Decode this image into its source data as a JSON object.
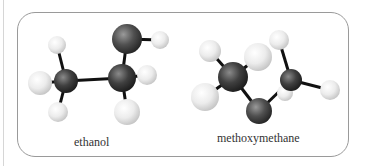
{
  "molecules": [
    {
      "name": "ethanol",
      "label": "ethanol",
      "atoms": [
        {
          "id": "H1",
          "element": "H",
          "x": 57,
          "y": 45,
          "r": 9
        },
        {
          "id": "H2",
          "element": "H",
          "x": 40,
          "y": 83,
          "r": 12
        },
        {
          "id": "H3",
          "element": "H",
          "x": 58,
          "y": 112,
          "r": 10
        },
        {
          "id": "C1",
          "element": "C",
          "x": 66,
          "y": 81,
          "r": 12
        },
        {
          "id": "O1",
          "element": "O",
          "x": 127,
          "y": 39,
          "r": 15
        },
        {
          "id": "H6",
          "element": "H",
          "x": 160,
          "y": 40,
          "r": 9
        },
        {
          "id": "H4",
          "element": "H",
          "x": 147,
          "y": 75,
          "r": 10
        },
        {
          "id": "C2",
          "element": "C",
          "x": 122,
          "y": 78,
          "r": 14
        },
        {
          "id": "H5",
          "element": "H",
          "x": 127,
          "y": 112,
          "r": 13
        }
      ],
      "bonds": [
        [
          "C1",
          "H1"
        ],
        [
          "C1",
          "H2"
        ],
        [
          "C1",
          "H3"
        ],
        [
          "C1",
          "C2"
        ],
        [
          "C2",
          "O1"
        ],
        [
          "O1",
          "H6"
        ],
        [
          "C2",
          "H4"
        ],
        [
          "C2",
          "H5"
        ]
      ]
    },
    {
      "name": "methoxymethane",
      "label": "methoxymethane",
      "atoms": [
        {
          "id": "H7",
          "element": "H",
          "x": 210,
          "y": 51,
          "r": 11
        },
        {
          "id": "H8",
          "element": "H",
          "x": 258,
          "y": 57,
          "r": 14
        },
        {
          "id": "H9",
          "element": "H",
          "x": 205,
          "y": 97,
          "r": 14
        },
        {
          "id": "C3",
          "element": "C",
          "x": 233,
          "y": 77,
          "r": 15
        },
        {
          "id": "H12",
          "element": "H",
          "x": 285,
          "y": 93,
          "r": 8
        },
        {
          "id": "O2",
          "element": "O",
          "x": 259,
          "y": 111,
          "r": 13
        },
        {
          "id": "H10",
          "element": "H",
          "x": 279,
          "y": 40,
          "r": 10
        },
        {
          "id": "C4",
          "element": "C",
          "x": 291,
          "y": 80,
          "r": 11
        },
        {
          "id": "H11",
          "element": "H",
          "x": 330,
          "y": 90,
          "r": 10
        }
      ],
      "bonds": [
        [
          "C3",
          "H7"
        ],
        [
          "C3",
          "H8"
        ],
        [
          "C3",
          "H9"
        ],
        [
          "C3",
          "O2"
        ],
        [
          "O2",
          "C4"
        ],
        [
          "C4",
          "H10"
        ],
        [
          "C4",
          "H11"
        ],
        [
          "C4",
          "H12"
        ]
      ]
    }
  ],
  "colors": {
    "frame_border": "#9a9a9a",
    "bond": "#111111",
    "carbon": "#3a3a3a",
    "oxygen": "#4a4a4a",
    "hydrogen": "#e6e6e6",
    "label": "#333333"
  }
}
